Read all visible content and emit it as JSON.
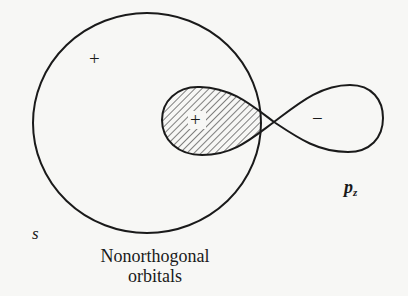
{
  "diagram": {
    "orbital_s": {
      "label": "s",
      "sign": "+"
    },
    "orbital_pz": {
      "label_main": "p",
      "label_sub": "z",
      "positive_lobe_sign": "+",
      "negative_lobe_sign": "−"
    },
    "overlap_region": {
      "description": "hatched overlap of s and positive p_z lobe"
    },
    "caption_line1": "Nonorthogonal",
    "caption_line2": "orbitals",
    "colors": {
      "stroke": "#1a1a1a",
      "background": "#f7f7f5"
    }
  }
}
